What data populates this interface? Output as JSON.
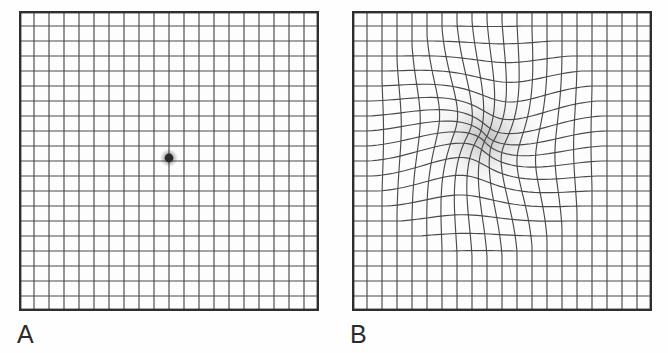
{
  "figure": {
    "background_color": "#ffffff",
    "width": 668,
    "height": 353
  },
  "panels": [
    {
      "id": "panel-a",
      "label": "A",
      "name": "normal-amsler-grid",
      "description": "Normal Amsler grid with straight, evenly spaced lines and a central fixation dot",
      "x": 19,
      "y": 11,
      "size": 300,
      "cells": 20,
      "cell_size": 15,
      "distorted": false,
      "line_color": "#4a4a4a",
      "border_color": "#2e2e2e",
      "background_color": "#fdfdfd",
      "fixation_dot": {
        "name": "central-fixation-dot",
        "cx": 150,
        "cy": 147,
        "r": 4.4,
        "color": "#2a2a2a",
        "halo_r": 9
      }
    },
    {
      "id": "panel-b",
      "label": "B",
      "name": "distorted-amsler-grid",
      "description": "Amsler grid showing metamorphopsia: lines bend and converge toward a central scotoma with a grey blurred patch",
      "x": 352,
      "y": 11,
      "size": 300,
      "cells": 20,
      "cell_size": 15,
      "distorted": true,
      "line_color": "#4a4a4a",
      "border_color": "#2e2e2e",
      "background_color": "#fdfdfd",
      "distortion": {
        "name": "metamorphopsia-distortion",
        "center_x": 133,
        "center_y": 127,
        "pull_strength": 0.62,
        "radius": 118,
        "swirl": 0.55,
        "scotoma": {
          "name": "central-scotoma-smudge",
          "cx": 133,
          "cy": 127,
          "r": 52,
          "color": "#9a9a9a",
          "peak_opacity": 0.62
        }
      }
    }
  ],
  "labels": {
    "panel_a": "A",
    "panel_b": "B",
    "font_size_px": 25,
    "color": "#2b2b2b"
  },
  "chart_data": {
    "type": "diagram",
    "panels": [
      "A",
      "B"
    ],
    "panel_a_meaning": "Normal perception — all grid lines straight and parallel",
    "panel_b_meaning": "Abnormal perception — wavy/bent lines with central grey blur (metamorphopsia / scotoma)",
    "grid_divisions": 20,
    "grid_pixels": 300
  }
}
